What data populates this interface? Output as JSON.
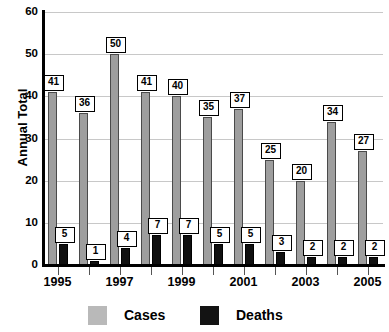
{
  "chart_data": {
    "type": "bar",
    "title": "",
    "subtitle": "",
    "xlabel": "",
    "ylabel": "Annual Total",
    "ylim": [
      0,
      60
    ],
    "yticks": [
      0,
      10,
      20,
      30,
      40,
      50,
      60
    ],
    "ytick_labels": [
      "0",
      "10",
      "20",
      "30",
      "40",
      "50",
      "60"
    ],
    "grid": true,
    "legend_position": "bottom",
    "categories": [
      "1995",
      "1996",
      "1997",
      "1998",
      "1999",
      "2000",
      "2001",
      "2002",
      "2003",
      "2004",
      "2005"
    ],
    "xtick_labels_shown": [
      "1995",
      "1997",
      "1999",
      "2001",
      "2003",
      "2005"
    ],
    "series": [
      {
        "name": "Cases",
        "color": "#9e9e9e",
        "values": [
          41,
          36,
          50,
          41,
          40,
          35,
          37,
          25,
          20,
          34,
          27
        ],
        "labels": [
          "41",
          "36",
          "50",
          "41",
          "40",
          "35",
          "37",
          "25",
          "20",
          "34",
          "27"
        ]
      },
      {
        "name": "Deaths",
        "color": "#101010",
        "values": [
          5,
          1,
          4,
          7,
          7,
          5,
          5,
          3,
          2,
          2,
          2
        ],
        "labels": [
          "5",
          "1",
          "4",
          "7",
          "7",
          "5",
          "5",
          "3",
          "2",
          "2",
          "2"
        ]
      }
    ]
  },
  "legend": {
    "items": [
      {
        "label": "Cases",
        "swatch": "cases-swatch"
      },
      {
        "label": "Deaths",
        "swatch": "deaths-swatch"
      }
    ]
  },
  "axes": {
    "y_title": "Annual Total"
  }
}
